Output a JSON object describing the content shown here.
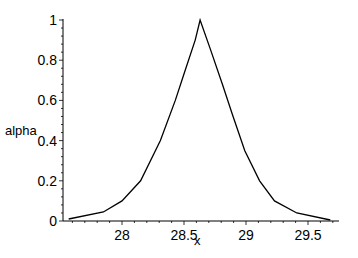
{
  "chart_data": {
    "type": "line",
    "title": "",
    "xlabel": "x",
    "ylabel": "alpha",
    "xlim": [
      27.52,
      29.75
    ],
    "ylim": [
      0,
      1
    ],
    "grid": false,
    "legend": null,
    "xticks": [
      28,
      28.5,
      29,
      29.5
    ],
    "xtick_labels": [
      "28",
      "28.5",
      "29",
      "29.5"
    ],
    "yticks": [
      0,
      0.2,
      0.4,
      0.6,
      0.8,
      1
    ],
    "ytick_labels": [
      "0",
      "0.2",
      "0.4",
      "0.6",
      "0.8",
      "1"
    ],
    "line_color": "#000000",
    "series": [
      {
        "name": "alpha",
        "x": [
          27.57,
          27.85,
          28.0,
          28.15,
          28.31,
          28.43,
          28.51,
          28.59,
          28.63,
          28.71,
          28.81,
          28.89,
          28.99,
          29.11,
          29.23,
          29.41,
          29.68
        ],
        "y": [
          0.01,
          0.045,
          0.1,
          0.2,
          0.4,
          0.6,
          0.75,
          0.9,
          1.0,
          0.86,
          0.68,
          0.53,
          0.35,
          0.2,
          0.1,
          0.04,
          0.005
        ]
      }
    ]
  }
}
